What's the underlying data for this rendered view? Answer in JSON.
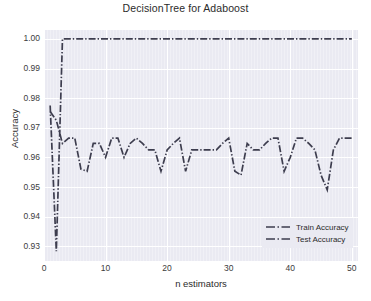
{
  "chart_data": {
    "type": "line",
    "title": "DecisionTree for Adaboost",
    "xlabel": "n estimators",
    "ylabel": "Accuracy",
    "xlim": [
      0,
      51
    ],
    "ylim": [
      0.925,
      1.003
    ],
    "xticks": [
      0,
      10,
      20,
      30,
      40,
      50
    ],
    "yticks": [
      0.93,
      0.94,
      0.95,
      0.96,
      0.97,
      0.98,
      0.99,
      1.0
    ],
    "ytick_labels": [
      "0.93",
      "0.94",
      "0.95",
      "0.96",
      "0.97",
      "0.98",
      "0.99",
      "1.00"
    ],
    "xtick_labels": [
      "0",
      "10",
      "20",
      "30",
      "40",
      "50"
    ],
    "grid": true,
    "legend_position": "lower right",
    "line_style": "dash-dot",
    "series_color": "#3d3d4e",
    "background": "#eaeaf2",
    "gridline_color": "#ffffff",
    "x": [
      1,
      2,
      3,
      4,
      5,
      6,
      7,
      8,
      9,
      10,
      11,
      12,
      13,
      14,
      15,
      16,
      17,
      18,
      19,
      20,
      21,
      22,
      23,
      24,
      25,
      26,
      27,
      28,
      29,
      30,
      31,
      32,
      33,
      34,
      35,
      36,
      37,
      38,
      39,
      40,
      41,
      42,
      43,
      44,
      45,
      46,
      47,
      48,
      49,
      50
    ],
    "series": [
      {
        "name": "Train Accuracy",
        "values": [
          0.9775,
          0.9283,
          1.0,
          1.0,
          1.0,
          1.0,
          1.0,
          1.0,
          1.0,
          1.0,
          1.0,
          1.0,
          1.0,
          1.0,
          1.0,
          1.0,
          1.0,
          1.0,
          1.0,
          1.0,
          1.0,
          1.0,
          1.0,
          1.0,
          1.0,
          1.0,
          1.0,
          1.0,
          1.0,
          1.0,
          1.0,
          1.0,
          1.0,
          1.0,
          1.0,
          1.0,
          1.0,
          1.0,
          1.0,
          1.0,
          1.0,
          1.0,
          1.0,
          1.0,
          1.0,
          1.0,
          1.0,
          1.0,
          1.0,
          1.0
        ]
      },
      {
        "name": "Test Accuracy",
        "values": [
          0.9755,
          0.9725,
          0.9647,
          0.9665,
          0.9665,
          0.956,
          0.9553,
          0.9647,
          0.9647,
          0.96,
          0.9665,
          0.9665,
          0.96,
          0.9647,
          0.9665,
          0.9647,
          0.9625,
          0.9625,
          0.9553,
          0.9625,
          0.9647,
          0.9665,
          0.9553,
          0.9625,
          0.9625,
          0.9625,
          0.9625,
          0.9625,
          0.9647,
          0.9665,
          0.9553,
          0.954,
          0.9647,
          0.9625,
          0.9625,
          0.9647,
          0.9665,
          0.9665,
          0.9553,
          0.96,
          0.9665,
          0.9665,
          0.9647,
          0.9625,
          0.954,
          0.949,
          0.9625,
          0.9665,
          0.9665,
          0.9665
        ]
      }
    ],
    "legend": [
      {
        "label": "Train Accuracy"
      },
      {
        "label": "Test Accuracy"
      }
    ]
  }
}
